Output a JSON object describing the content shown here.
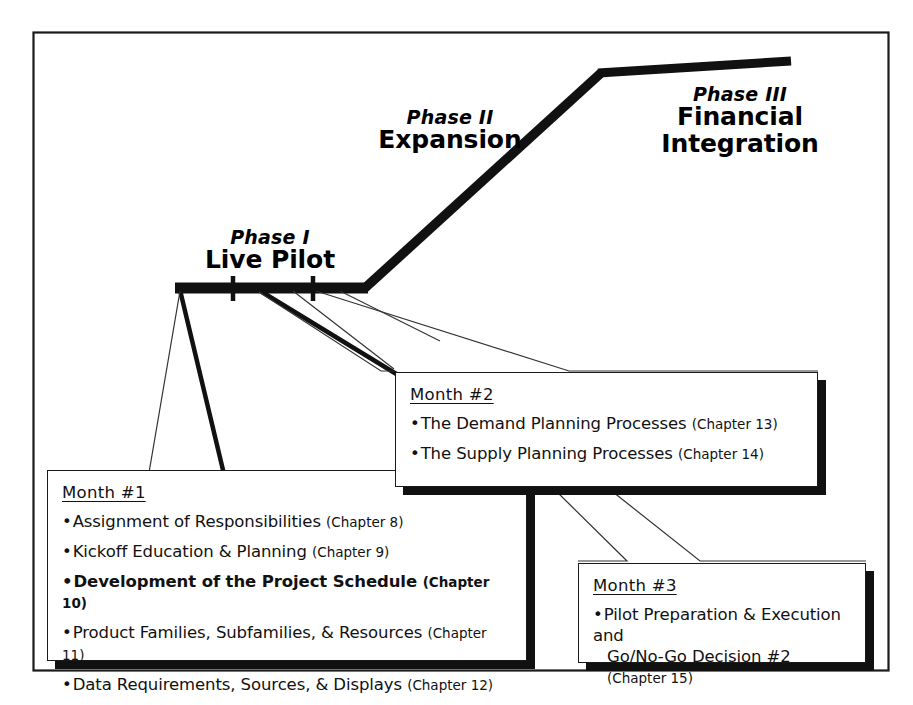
{
  "diagram": {
    "frame_color": "#1a1a1a",
    "line_color": "#111111"
  },
  "phases": [
    {
      "id": "phase-1",
      "kicker": "Phase I",
      "name": "Live Pilot"
    },
    {
      "id": "phase-2",
      "kicker": "Phase II",
      "name": "Expansion"
    },
    {
      "id": "phase-3",
      "kicker": "Phase III",
      "name_line_1": "Financial",
      "name_line_2": "Integration"
    }
  ],
  "months": [
    {
      "id": "month-1",
      "title": "Month #1",
      "items": [
        {
          "bullet": "•",
          "text": "Assignment of Responsibilities ",
          "chapter": "(Chapter 8)",
          "emphasis": false
        },
        {
          "bullet": "•",
          "text": "Kickoff Education & Planning ",
          "chapter": "(Chapter 9)",
          "emphasis": false
        },
        {
          "bullet": "•",
          "text": "Development of the Project Schedule ",
          "chapter": "(Chapter 10)",
          "emphasis": true
        },
        {
          "bullet": "•",
          "text": "Product Families, Subfamilies, & Resources ",
          "chapter": "(Chapter 11)",
          "emphasis": false
        },
        {
          "bullet": "•",
          "text": "Data Requirements, Sources, & Displays ",
          "chapter": "(Chapter 12)",
          "emphasis": false
        }
      ]
    },
    {
      "id": "month-2",
      "title": "Month #2",
      "items": [
        {
          "bullet": "•",
          "text": "The Demand Planning Processes ",
          "chapter": "(Chapter 13)",
          "emphasis": false
        },
        {
          "bullet": "•",
          "text": "The Supply Planning Processes ",
          "chapter": "(Chapter 14)",
          "emphasis": false
        }
      ]
    },
    {
      "id": "month-3",
      "title": "Month #3",
      "items": [
        {
          "bullet": "•",
          "text": "Pilot Preparation & Execution and",
          "wrap": "Go/No-Go Decision #2 ",
          "chapter": "(Chapter 15)",
          "emphasis": false
        }
      ]
    }
  ]
}
